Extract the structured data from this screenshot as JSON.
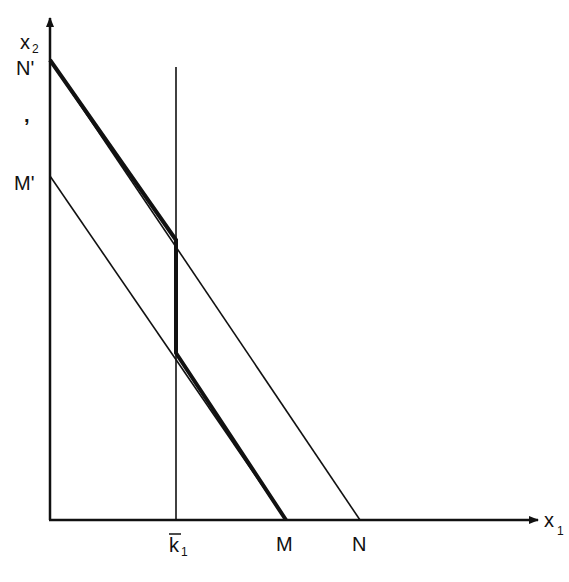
{
  "diagram": {
    "type": "budget-constraint-kinked",
    "axes": {
      "y_label": "x",
      "y_label_sub": "2",
      "x_label": "x",
      "x_label_sub": "1"
    },
    "y_axis_labels": {
      "n_prime": "N'",
      "comma_mark": ",",
      "m_prime": "M'"
    },
    "x_axis_labels": {
      "k_bar": "k",
      "k_bar_sub": "1",
      "m": "M",
      "n": "N"
    },
    "lines": [
      {
        "name": "line-N-prime-to-N",
        "from": "N'",
        "to": "N",
        "weight": "thin"
      },
      {
        "name": "line-M-prime-to-M",
        "from": "M'",
        "to": "M",
        "weight": "thin"
      },
      {
        "name": "vertical-k1",
        "at": "k1 bar",
        "weight": "thin"
      },
      {
        "name": "kinked-constraint",
        "path": [
          "N'",
          "k1 ∩ N'N",
          "k1 ∩ M'M",
          "M"
        ],
        "weight": "thick"
      }
    ],
    "colors": {
      "ink": "#111111",
      "background": "#ffffff"
    }
  }
}
